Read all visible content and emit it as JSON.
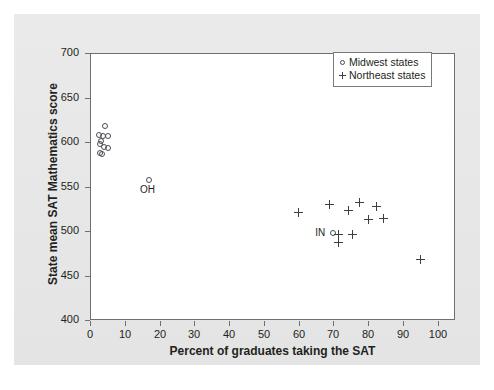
{
  "chart_data": {
    "type": "scatter",
    "title": "",
    "xlabel": "Percent of graduates taking the SAT",
    "ylabel": "State mean SAT Mathematics score",
    "xlim": [
      0,
      105
    ],
    "ylim": [
      400,
      700
    ],
    "xticks": [
      0,
      10,
      20,
      30,
      40,
      50,
      60,
      70,
      80,
      90,
      100
    ],
    "yticks": [
      400,
      450,
      500,
      550,
      600,
      650,
      700
    ],
    "xtick_labels": [
      "0",
      "10",
      "20",
      "30",
      "40",
      "50",
      "60",
      "70",
      "80",
      "90",
      "100"
    ],
    "ytick_labels": [
      "400",
      "450",
      "500",
      "550",
      "600",
      "650",
      "700"
    ],
    "grid": false,
    "legend_position": "top-right",
    "series": [
      {
        "name": "Midwest states",
        "marker": "circle",
        "marker_color": "#4a4a55",
        "points": [
          {
            "x": 4.6,
            "y": 617
          },
          {
            "x": 2.6,
            "y": 607
          },
          {
            "x": 4.0,
            "y": 606
          },
          {
            "x": 5.4,
            "y": 606
          },
          {
            "x": 3.4,
            "y": 601
          },
          {
            "x": 3.0,
            "y": 597
          },
          {
            "x": 4.3,
            "y": 594
          },
          {
            "x": 5.2,
            "y": 593
          },
          {
            "x": 3.1,
            "y": 587
          },
          {
            "x": 3.6,
            "y": 586
          },
          {
            "x": 17.0,
            "y": 557,
            "label": "OH"
          },
          {
            "x": 70.0,
            "y": 497,
            "label": "IN"
          }
        ]
      },
      {
        "name": "Northeast states",
        "marker": "plus",
        "marker_color": "#3d3d47",
        "points": [
          {
            "x": 60.0,
            "y": 521
          },
          {
            "x": 69.0,
            "y": 530
          },
          {
            "x": 74.5,
            "y": 523
          },
          {
            "x": 77.5,
            "y": 532
          },
          {
            "x": 80.0,
            "y": 513
          },
          {
            "x": 82.5,
            "y": 528
          },
          {
            "x": 84.5,
            "y": 514
          },
          {
            "x": 71.5,
            "y": 496
          },
          {
            "x": 75.5,
            "y": 496
          },
          {
            "x": 71.5,
            "y": 487
          },
          {
            "x": 95.0,
            "y": 468
          }
        ]
      }
    ]
  },
  "legend": {
    "items": [
      {
        "key": "circle",
        "label": "Midwest states"
      },
      {
        "key": "plus",
        "label": "Northeast states"
      }
    ]
  }
}
